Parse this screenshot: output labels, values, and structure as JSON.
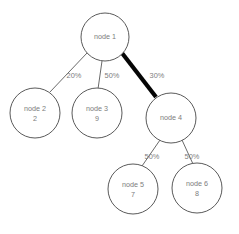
{
  "diagram": {
    "type": "tree",
    "title": "",
    "background_color": "#ffffff",
    "node_stroke_color": "#5a5a5a",
    "text_color": "#7d7d7d",
    "edge_color": "#6a6a6a",
    "highlight_edge_color": "#050505",
    "nodes": [
      {
        "id": "node1",
        "label": "node 1",
        "value": "",
        "cx": 105,
        "cy": 37,
        "r": 24
      },
      {
        "id": "node2",
        "label": "node 2",
        "value": "2",
        "cx": 35,
        "cy": 113,
        "r": 25
      },
      {
        "id": "node3",
        "label": "node 3",
        "value": "9",
        "cx": 97,
        "cy": 113,
        "r": 25
      },
      {
        "id": "node4",
        "label": "node 4",
        "value": "",
        "cx": 171,
        "cy": 118,
        "r": 25
      },
      {
        "id": "node5",
        "label": "node 5",
        "value": "7",
        "cx": 133,
        "cy": 189,
        "r": 25
      },
      {
        "id": "node6",
        "label": "node 6",
        "value": "8",
        "cx": 197,
        "cy": 188,
        "r": 25
      }
    ],
    "edges": [
      {
        "id": "edge-1-2",
        "from": "node1",
        "to": "node2",
        "label": "20%",
        "highlight": false,
        "x1": 87,
        "y1": 53,
        "x2": 50,
        "y2": 92,
        "lx": 74,
        "ly": 76
      },
      {
        "id": "edge-1-3",
        "from": "node1",
        "to": "node3",
        "label": "50%",
        "highlight": false,
        "x1": 102,
        "y1": 61,
        "x2": 98,
        "y2": 89,
        "lx": 112,
        "ly": 76
      },
      {
        "id": "edge-1-4",
        "from": "node1",
        "to": "node4",
        "label": "30%",
        "highlight": true,
        "x1": 122,
        "y1": 53,
        "x2": 156,
        "y2": 97,
        "lx": 157,
        "ly": 76
      },
      {
        "id": "edge-4-5",
        "from": "node4",
        "to": "node5",
        "label": "50%",
        "highlight": false,
        "x1": 160,
        "y1": 140,
        "x2": 142,
        "y2": 166,
        "lx": 152,
        "ly": 157
      },
      {
        "id": "edge-4-6",
        "from": "node4",
        "to": "node6",
        "label": "50%",
        "highlight": false,
        "x1": 182,
        "y1": 140,
        "x2": 193,
        "y2": 164,
        "lx": 192,
        "ly": 157
      }
    ]
  }
}
